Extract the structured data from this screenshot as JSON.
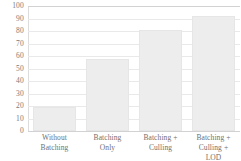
{
  "chart_data": {
    "type": "bar",
    "title": "",
    "subtitle": "",
    "xlabel": "",
    "ylabel": "",
    "categories": [
      "Without Batching",
      "Batching Only",
      "Batching + Culling",
      "Batching + Culling + LOD"
    ],
    "category_lines": [
      [
        "Without",
        "Batching"
      ],
      [
        "Batching",
        "Only"
      ],
      [
        "Batching +",
        "Culling"
      ],
      [
        "Batching +",
        "Culling +",
        "LOD"
      ]
    ],
    "values": [
      19,
      58,
      81,
      92
    ],
    "ylim": [
      0,
      100
    ],
    "ytick_step": 10,
    "yticks": [
      "100",
      "90",
      "80",
      "70",
      "60",
      "50",
      "40",
      "30",
      "20",
      "10",
      "0"
    ],
    "ytick_values": [
      100,
      90,
      80,
      70,
      60,
      50,
      40,
      30,
      20,
      10,
      0
    ],
    "grid": true,
    "legend": false,
    "legend_position": "none",
    "annotations": [],
    "colors": {
      "bar_fill": "#ededed",
      "bar_stroke": "#e6e6e6",
      "gridline": "#e9e9e9",
      "axis": "#d2d2d2",
      "text": "#6f6f6f",
      "background": "#ffffff"
    }
  }
}
